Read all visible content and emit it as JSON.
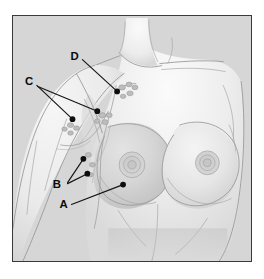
{
  "figure": {
    "background_color": "#d6d6d6",
    "frame_color": "#3a3a3c",
    "page_color": "#ffffff",
    "label_color": "#0b0b0b",
    "leader_color": "#141414"
  },
  "callouts": [
    {
      "id": "a",
      "label": "A",
      "label_x": 63,
      "label_y": 192,
      "targets": [
        {
          "x": 111,
          "y": 170
        }
      ]
    },
    {
      "id": "b",
      "label": "B",
      "label_x": 56,
      "label_y": 170,
      "targets": [
        {
          "x": 71,
          "y": 144
        },
        {
          "x": 75,
          "y": 159
        }
      ]
    },
    {
      "id": "c",
      "label": "C",
      "label_x": 17,
      "label_y": 66,
      "targets": [
        {
          "x": 60,
          "y": 104
        },
        {
          "x": 85,
          "y": 96
        }
      ]
    },
    {
      "id": "d",
      "label": "D",
      "label_x": 65,
      "label_y": 40,
      "targets": [
        {
          "x": 105,
          "y": 76
        }
      ]
    }
  ],
  "regions": [
    {
      "name": "left-breast",
      "label": "left breast"
    },
    {
      "name": "right-breast",
      "label": "right breast"
    },
    {
      "name": "left-areola",
      "label": "left areola"
    },
    {
      "name": "right-areola",
      "label": "right areola"
    },
    {
      "name": "raised-arm",
      "label": "raised arm"
    },
    {
      "name": "axilla",
      "label": "axilla"
    },
    {
      "name": "clavicle",
      "label": "clavicle"
    },
    {
      "name": "sternal-notch",
      "label": "sternal notch"
    },
    {
      "name": "lymph-node-chain",
      "label": "lymph node chain"
    }
  ]
}
